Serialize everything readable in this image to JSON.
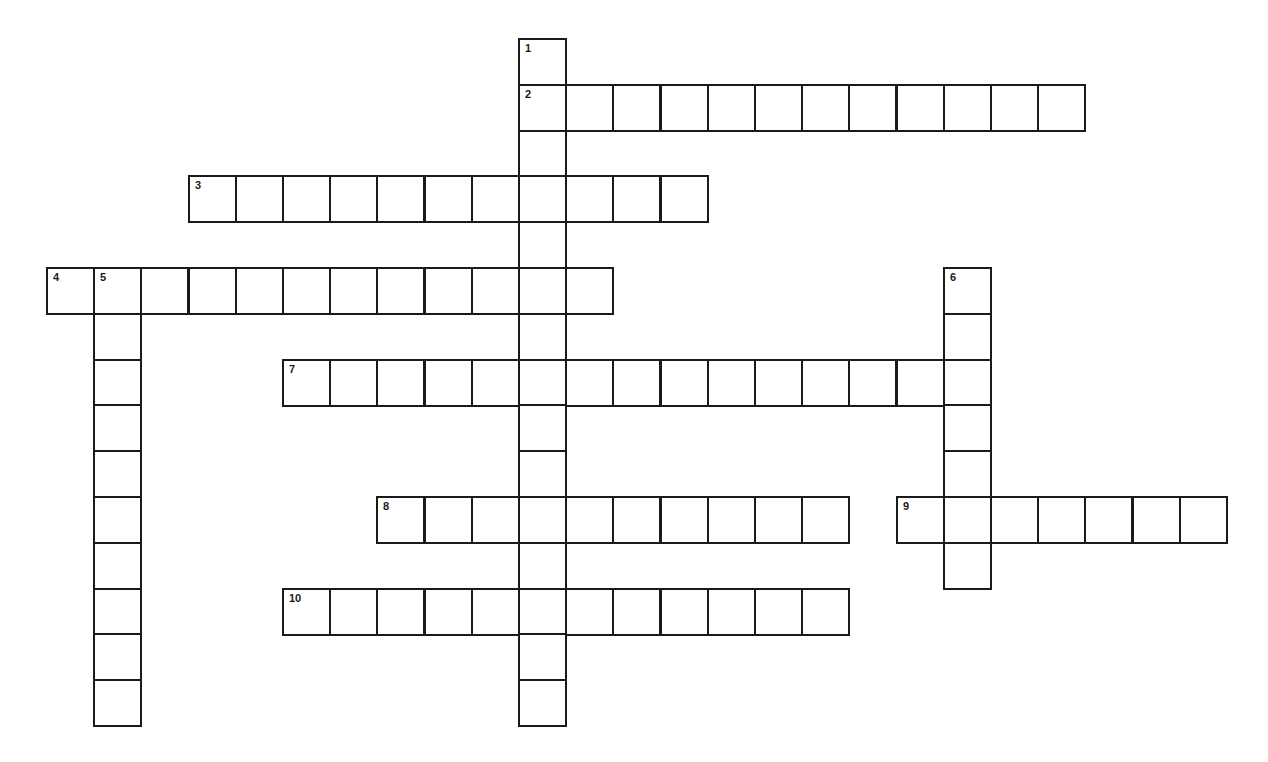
{
  "puzzle": {
    "type": "crossword",
    "grid": {
      "origin_x": 47,
      "origin_y": 39,
      "cell_w": 47.2,
      "cell_h": 45.8,
      "line_color": "#1a1a1a",
      "background": "#ffffff"
    },
    "words": [
      {
        "number": "1",
        "direction": "down",
        "row": 0,
        "col": 10,
        "length": 15
      },
      {
        "number": "2",
        "direction": "across",
        "row": 1,
        "col": 10,
        "length": 12
      },
      {
        "number": "3",
        "direction": "across",
        "row": 3,
        "col": 3,
        "length": 11
      },
      {
        "number": "4",
        "direction": "across",
        "row": 5,
        "col": 0,
        "length": 12
      },
      {
        "number": "5",
        "direction": "down",
        "row": 5,
        "col": 1,
        "length": 10
      },
      {
        "number": "6",
        "direction": "down",
        "row": 5,
        "col": 19,
        "length": 7
      },
      {
        "number": "7",
        "direction": "across",
        "row": 7,
        "col": 5,
        "length": 15
      },
      {
        "number": "8",
        "direction": "across",
        "row": 10,
        "col": 7,
        "length": 10
      },
      {
        "number": "9",
        "direction": "across",
        "row": 10,
        "col": 18,
        "length": 7
      },
      {
        "number": "10",
        "direction": "across",
        "row": 12,
        "col": 5,
        "length": 12
      }
    ]
  }
}
